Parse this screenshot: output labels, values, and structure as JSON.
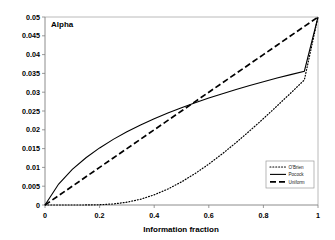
{
  "chart_data": {
    "type": "line",
    "title": "",
    "corner_label": "Alpha",
    "xlabel": "Information fraction",
    "ylabel": "Alpha",
    "xlim": [
      0,
      1
    ],
    "ylim": [
      0,
      0.05
    ],
    "grid": false,
    "legend_position": "bottom-right",
    "xticks": [
      0,
      0.2,
      0.4,
      0.6,
      0.8,
      1
    ],
    "xtick_labels": [
      "0",
      "0.2",
      "0.4",
      "0.6",
      "0.8",
      "1"
    ],
    "yticks": [
      0,
      0.005,
      0.01,
      0.015,
      0.02,
      0.025,
      0.03,
      0.035,
      0.04,
      0.045,
      0.05
    ],
    "ytick_labels": [
      "0",
      "0.005",
      "0.01",
      "0.015",
      "0.02",
      "0.025",
      "0.03",
      "0.035",
      "0.04",
      "0.045",
      "0.05"
    ],
    "x": [
      0,
      0.05,
      0.1,
      0.15,
      0.2,
      0.25,
      0.3,
      0.35,
      0.4,
      0.45,
      0.5,
      0.55,
      0.6,
      0.65,
      0.7,
      0.75,
      0.8,
      0.85,
      0.9,
      0.95,
      1
    ],
    "series": [
      {
        "name": "O'Brien",
        "style": "dotted",
        "color": "#000000",
        "values": [
          0,
          0.0,
          2e-07,
          8e-06,
          7e-05,
          0.00028,
          0.00074,
          0.00153,
          0.0027,
          0.00424,
          0.00614,
          0.00837,
          0.01088,
          0.01364,
          0.0166,
          0.01973,
          0.02298,
          0.02634,
          0.02977,
          0.03325,
          0.05
        ]
      },
      {
        "name": "Pocock",
        "style": "solid",
        "color": "#000000",
        "values": [
          0,
          0.00558,
          0.00947,
          0.01257,
          0.01518,
          0.01745,
          0.01946,
          0.02127,
          0.02292,
          0.02445,
          0.02586,
          0.02719,
          0.02843,
          0.02961,
          0.03072,
          0.03178,
          0.03279,
          0.03376,
          0.03468,
          0.03558,
          0.05
        ]
      },
      {
        "name": "Uniform",
        "style": "dashed",
        "color": "#000000",
        "values": [
          0,
          0.0025,
          0.005,
          0.0075,
          0.01,
          0.0125,
          0.015,
          0.0175,
          0.02,
          0.0225,
          0.025,
          0.0275,
          0.03,
          0.0325,
          0.035,
          0.0375,
          0.04,
          0.0425,
          0.045,
          0.0475,
          0.05
        ]
      }
    ],
    "legend": [
      {
        "label": "O'Brien",
        "style": "dotted"
      },
      {
        "label": "Pocock",
        "style": "solid"
      },
      {
        "label": "Uniform",
        "style": "dashed"
      }
    ]
  }
}
